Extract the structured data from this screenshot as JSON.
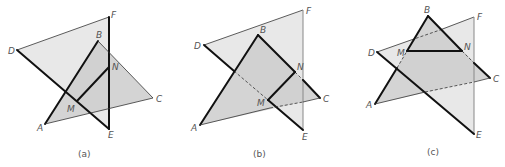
{
  "figures": [
    {
      "id": "a",
      "caption": "(a)",
      "labels": {
        "D": "D",
        "F": "F",
        "B": "B",
        "N": "N",
        "C": "C",
        "M": "M",
        "A": "A",
        "E": "E"
      }
    },
    {
      "id": "b",
      "caption": "(b)",
      "labels": {
        "D": "D",
        "F": "F",
        "B": "B",
        "N": "N",
        "C": "C",
        "M": "M",
        "A": "A",
        "E": "E"
      }
    },
    {
      "id": "c",
      "caption": "(c)",
      "labels": {
        "D": "D",
        "F": "F",
        "B": "B",
        "N": "N",
        "C": "C",
        "M": "M",
        "A": "A",
        "E": "E"
      }
    }
  ],
  "colors": {
    "plane_def": "#e6e6e6",
    "plane_abc": "#cfcfcf",
    "overlap": "#bdbdbd",
    "edge": "#111111"
  }
}
